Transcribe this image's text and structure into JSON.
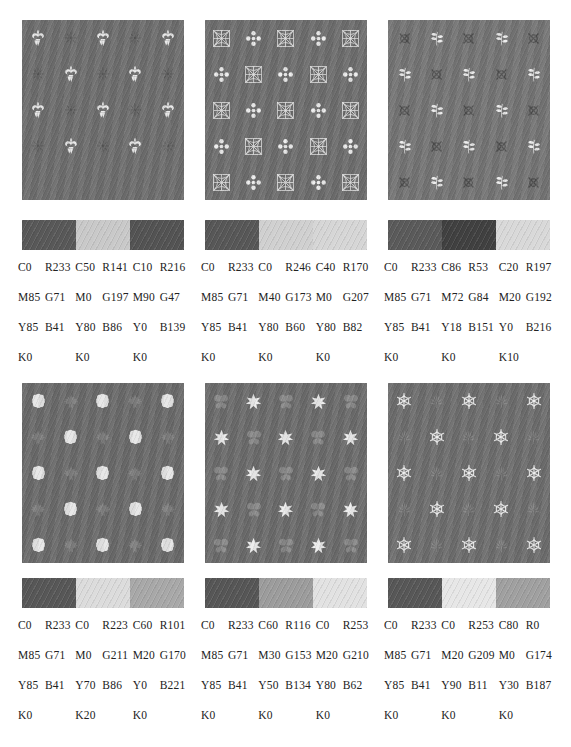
{
  "page": {
    "type": "color-swatch-chart",
    "layout": "2 rows x 3 columns of textile pattern samples, each with a 3-colour swatch strip and CMYK/RGB value table",
    "background": "#ffffff"
  },
  "panels": [
    {
      "id": "panel-1",
      "row": 1,
      "col": 1,
      "motif_a": "fleur-de-lis",
      "motif_b": "small-floral-star",
      "pattern_bg": "#6e6e6e",
      "motif_a_color": "#e8e8e8",
      "motif_b_color": "#585858",
      "swatches": [
        {
          "hex": "#585858",
          "cmyk": {
            "C": "C0",
            "M": "M85",
            "Y": "Y85",
            "K": "K0"
          },
          "rgb": {
            "R": "R233",
            "G": "G71",
            "B": "B41"
          }
        },
        {
          "hex": "#c9c9c9",
          "cmyk": {
            "C": "C50",
            "M": "M0",
            "Y": "Y80",
            "K": "K0"
          },
          "rgb": {
            "R": "R141",
            "G": "G197",
            "B": "B86"
          }
        },
        {
          "hex": "#535353",
          "cmyk": {
            "C": "C10",
            "M": "M90",
            "Y": "Y0",
            "K": "K0"
          },
          "rgb": {
            "R": "R216",
            "G": "G47",
            "B": "B139"
          }
        }
      ]
    },
    {
      "id": "panel-2",
      "row": 1,
      "col": 2,
      "motif_a": "square-lattice-medallion",
      "motif_b": "four-petal-clover",
      "pattern_bg": "#6e6e6e",
      "motif_a_color": "#e2e2e2",
      "motif_b_color": "#ededed",
      "swatches": [
        {
          "hex": "#575757",
          "cmyk": {
            "C": "C0",
            "M": "M85",
            "Y": "Y85",
            "K": "K0"
          },
          "rgb": {
            "R": "R233",
            "G": "G71",
            "B": "B41"
          }
        },
        {
          "hex": "#d0d0d0",
          "cmyk": {
            "C": "C0",
            "M": "M40",
            "Y": "Y80",
            "K": "K0"
          },
          "rgb": {
            "R": "R246",
            "G": "G173",
            "B": "B60"
          }
        },
        {
          "hex": "#d6d6d6",
          "cmyk": {
            "C": "C40",
            "M": "M0",
            "Y": "Y80",
            "K": "K0"
          },
          "rgb": {
            "R": "R170",
            "G": "G207",
            "B": "B82"
          }
        }
      ]
    },
    {
      "id": "panel-3",
      "row": 1,
      "col": 3,
      "motif_a": "dark-rosette-cross",
      "motif_b": "leafy-branch",
      "pattern_bg": "#757575",
      "motif_a_color": "#4f4f4f",
      "motif_b_color": "#ededed",
      "swatches": [
        {
          "hex": "#5a5a5a",
          "cmyk": {
            "C": "C0",
            "M": "M85",
            "Y": "Y85",
            "K": "K0"
          },
          "rgb": {
            "R": "R233",
            "G": "G71",
            "B": "B41"
          }
        },
        {
          "hex": "#404040",
          "cmyk": {
            "C": "C86",
            "M": "M72",
            "Y": "Y18",
            "K": "K0"
          },
          "rgb": {
            "R": "R53",
            "G": "G84",
            "B": "B151"
          }
        },
        {
          "hex": "#d9d9d9",
          "cmyk": {
            "C": "C20",
            "M": "M20",
            "Y": "Y0",
            "K": "K10"
          },
          "rgb": {
            "R": "R197",
            "G": "G192",
            "B": "B216"
          }
        }
      ]
    },
    {
      "id": "panel-4",
      "row": 2,
      "col": 1,
      "motif_a": "round-blossom",
      "motif_b": "maple-leaf",
      "pattern_bg": "#6b6b6b",
      "motif_a_color": "#e6e6e6",
      "motif_b_color": "#7f7f7f",
      "swatches": [
        {
          "hex": "#575757",
          "cmyk": {
            "C": "C0",
            "M": "M85",
            "Y": "Y85",
            "K": "K0"
          },
          "rgb": {
            "R": "R233",
            "G": "G71",
            "B": "B41"
          }
        },
        {
          "hex": "#dcdcdc",
          "cmyk": {
            "C": "C0",
            "M": "M0",
            "Y": "Y70",
            "K": "K20"
          },
          "rgb": {
            "R": "R223",
            "G": "G211",
            "B": "B86"
          }
        },
        {
          "hex": "#a8a8a8",
          "cmyk": {
            "C": "C60",
            "M": "M20",
            "Y": "Y0",
            "K": "K0"
          },
          "rgb": {
            "R": "R101",
            "G": "G170",
            "B": "B221"
          }
        }
      ]
    },
    {
      "id": "panel-5",
      "row": 2,
      "col": 2,
      "motif_a": "butterfly",
      "motif_b": "six-point-star-flower",
      "pattern_bg": "#6c6c6c",
      "motif_a_color": "#8a8a8a",
      "motif_b_color": "#ececec",
      "swatches": [
        {
          "hex": "#565656",
          "cmyk": {
            "C": "C0",
            "M": "M85",
            "Y": "Y85",
            "K": "K0"
          },
          "rgb": {
            "R": "R233",
            "G": "G71",
            "B": "B41"
          }
        },
        {
          "hex": "#9c9c9c",
          "cmyk": {
            "C": "C60",
            "M": "M30",
            "Y": "Y50",
            "K": "K0"
          },
          "rgb": {
            "R": "R116",
            "G": "G153",
            "B": "B134"
          }
        },
        {
          "hex": "#e2e2e2",
          "cmyk": {
            "C": "C0",
            "M": "M20",
            "Y": "Y80",
            "K": "K0"
          },
          "rgb": {
            "R": "R253",
            "G": "G210",
            "B": "B62"
          }
        }
      ]
    },
    {
      "id": "panel-6",
      "row": 2,
      "col": 3,
      "motif_a": "snowflake",
      "motif_b": "palmate-leaf",
      "pattern_bg": "#6e6e6e",
      "motif_a_color": "#ededed",
      "motif_b_color": "#848484",
      "swatches": [
        {
          "hex": "#575757",
          "cmyk": {
            "C": "C0",
            "M": "M85",
            "Y": "Y85",
            "K": "K0"
          },
          "rgb": {
            "R": "R233",
            "G": "G71",
            "B": "B41"
          }
        },
        {
          "hex": "#e7e7e7",
          "cmyk": {
            "C": "C0",
            "M": "M20",
            "Y": "Y90",
            "K": "K0"
          },
          "rgb": {
            "R": "R253",
            "G": "G209",
            "B": "B11"
          }
        },
        {
          "hex": "#a0a0a0",
          "cmyk": {
            "C": "C80",
            "M": "M0",
            "Y": "Y30",
            "K": "K0"
          },
          "rgb": {
            "R": "R0",
            "G": "G174",
            "B": "B187"
          }
        }
      ]
    }
  ]
}
